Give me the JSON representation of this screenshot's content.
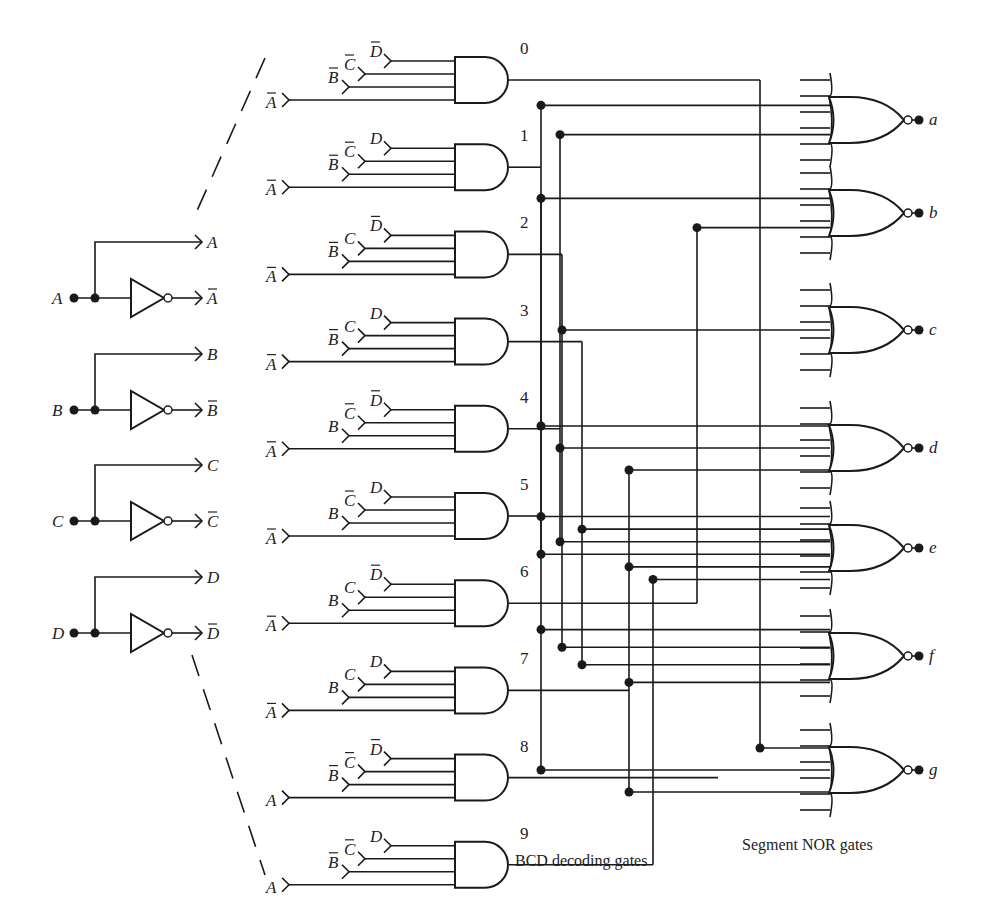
{
  "captions": {
    "decoding": "BCD decoding gates",
    "segment": "Segment NOR gates"
  },
  "inputs": [
    {
      "name": "A",
      "true_out": "A",
      "comp_out": "A",
      "y": 298
    },
    {
      "name": "B",
      "true_out": "B",
      "comp_out": "B",
      "y": 410
    },
    {
      "name": "C",
      "true_out": "C",
      "comp_out": "C",
      "y": 521
    },
    {
      "name": "D",
      "true_out": "D",
      "comp_out": "D",
      "y": 633
    }
  ],
  "and_gates": [
    {
      "digit": "0",
      "inputs": [
        {
          "v": "D",
          "bar": true
        },
        {
          "v": "C",
          "bar": true
        },
        {
          "v": "B",
          "bar": true
        },
        {
          "v": "A",
          "bar": true
        }
      ]
    },
    {
      "digit": "1",
      "inputs": [
        {
          "v": "D",
          "bar": false
        },
        {
          "v": "C",
          "bar": true
        },
        {
          "v": "B",
          "bar": true
        },
        {
          "v": "A",
          "bar": true
        }
      ]
    },
    {
      "digit": "2",
      "inputs": [
        {
          "v": "D",
          "bar": true
        },
        {
          "v": "C",
          "bar": false
        },
        {
          "v": "B",
          "bar": true
        },
        {
          "v": "A",
          "bar": true
        }
      ]
    },
    {
      "digit": "3",
      "inputs": [
        {
          "v": "D",
          "bar": false
        },
        {
          "v": "C",
          "bar": false
        },
        {
          "v": "B",
          "bar": true
        },
        {
          "v": "A",
          "bar": true
        }
      ]
    },
    {
      "digit": "4",
      "inputs": [
        {
          "v": "D",
          "bar": true
        },
        {
          "v": "C",
          "bar": true
        },
        {
          "v": "B",
          "bar": false
        },
        {
          "v": "A",
          "bar": true
        }
      ]
    },
    {
      "digit": "5",
      "inputs": [
        {
          "v": "D",
          "bar": false
        },
        {
          "v": "C",
          "bar": true
        },
        {
          "v": "B",
          "bar": false
        },
        {
          "v": "A",
          "bar": true
        }
      ]
    },
    {
      "digit": "6",
      "inputs": [
        {
          "v": "D",
          "bar": true
        },
        {
          "v": "C",
          "bar": false
        },
        {
          "v": "B",
          "bar": false
        },
        {
          "v": "A",
          "bar": true
        }
      ]
    },
    {
      "digit": "7",
      "inputs": [
        {
          "v": "D",
          "bar": false
        },
        {
          "v": "C",
          "bar": false
        },
        {
          "v": "B",
          "bar": false
        },
        {
          "v": "A",
          "bar": true
        }
      ]
    },
    {
      "digit": "8",
      "inputs": [
        {
          "v": "D",
          "bar": true
        },
        {
          "v": "C",
          "bar": true
        },
        {
          "v": "B",
          "bar": true
        },
        {
          "v": "A",
          "bar": false
        }
      ]
    },
    {
      "digit": "9",
      "inputs": [
        {
          "v": "D",
          "bar": false
        },
        {
          "v": "C",
          "bar": true
        },
        {
          "v": "B",
          "bar": true
        },
        {
          "v": "A",
          "bar": false
        }
      ]
    }
  ],
  "nor_gates": [
    {
      "segment": "a",
      "y": 120
    },
    {
      "segment": "b",
      "y": 213
    },
    {
      "segment": "c",
      "y": 330
    },
    {
      "segment": "d",
      "y": 448
    },
    {
      "segment": "e",
      "y": 548
    },
    {
      "segment": "f",
      "y": 656
    },
    {
      "segment": "g",
      "y": 770
    }
  ]
}
